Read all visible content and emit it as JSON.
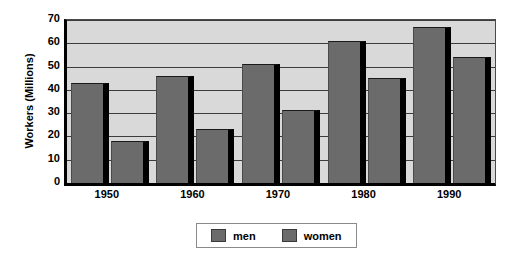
{
  "chart_data": {
    "type": "bar",
    "title": "",
    "subtitle": "",
    "xlabel": "",
    "ylabel": "Workers (Millions)",
    "categories": [
      "1950",
      "1960",
      "1970",
      "1980",
      "1990"
    ],
    "series": [
      {
        "name": "men",
        "values": [
          43,
          46,
          51,
          61,
          67
        ]
      },
      {
        "name": "women",
        "values": [
          18,
          23,
          31.5,
          45,
          54
        ]
      }
    ],
    "ylim": [
      0,
      70
    ],
    "ytick_values": [
      0,
      10,
      20,
      30,
      40,
      50,
      60,
      70
    ],
    "ytick_labels": [
      "0",
      "10",
      "20",
      "30",
      "40",
      "50",
      "60",
      "70"
    ],
    "grid": true,
    "grid_axis": "y",
    "legend_position": "bottom",
    "legend_entries": [
      "men",
      "women"
    ],
    "colors": {
      "bar_fill": "#6b6b6b",
      "bar_shadow": "#000000",
      "plot_background": "#d9d9d9",
      "gridline": "#3c3c3c",
      "axis": "#000000",
      "figure_background": "#ffffff",
      "text": "#000000",
      "legend_background": "#ffffff",
      "legend_border": "#8a8a8a"
    }
  }
}
